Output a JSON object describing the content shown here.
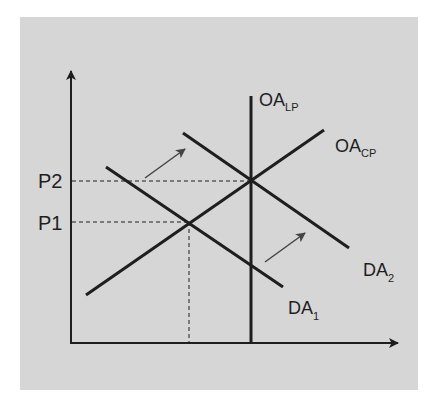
{
  "diagram": {
    "colors": {
      "background": "#d6d6d6",
      "line": "#1e1e1e",
      "arrow": "#444444",
      "page": "#ffffff"
    },
    "axes": {
      "y_axis": {
        "label": ""
      },
      "x_axis": {
        "label": ""
      }
    },
    "price_labels": {
      "p2": "P2",
      "p1": "P1"
    },
    "curves": {
      "oa_lp": {
        "main": "OA",
        "sub": "LP"
      },
      "oa_cp": {
        "main": "OA",
        "sub": "CP"
      },
      "da1": {
        "main": "DA",
        "sub": "1"
      },
      "da2": {
        "main": "DA",
        "sub": "2"
      }
    },
    "shift_arrows": [
      {
        "name": "shift-arrow-upper",
        "from": [
          145,
          178
        ],
        "to": [
          185,
          149
        ]
      },
      {
        "name": "shift-arrow-lower",
        "from": [
          265,
          262
        ],
        "to": [
          305,
          233
        ]
      }
    ]
  }
}
